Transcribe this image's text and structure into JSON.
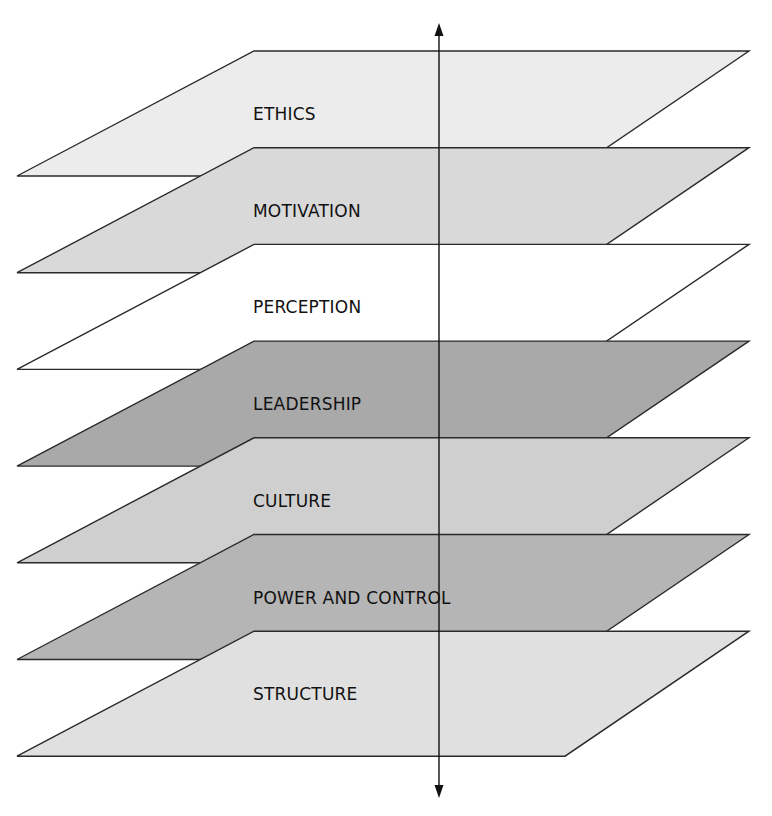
{
  "diagram": {
    "type": "stacked-layers",
    "axis": {
      "direction": "bidirectional-vertical",
      "icons": [
        "arrow-up-icon",
        "arrow-down-icon"
      ]
    },
    "layers": [
      {
        "label": "ETHICS",
        "fill": "#ececec"
      },
      {
        "label": "MOTIVATION",
        "fill": "#d9d9d9"
      },
      {
        "label": "PERCEPTION",
        "fill": "#ffffff"
      },
      {
        "label": "LEADERSHIP",
        "fill": "#a9a9a9"
      },
      {
        "label": "CULTURE",
        "fill": "#cfcfcf"
      },
      {
        "label": "POWER AND CONTROL",
        "fill": "#b5b5b5"
      },
      {
        "label": "STRUCTURE",
        "fill": "#e0e0e0"
      }
    ]
  }
}
